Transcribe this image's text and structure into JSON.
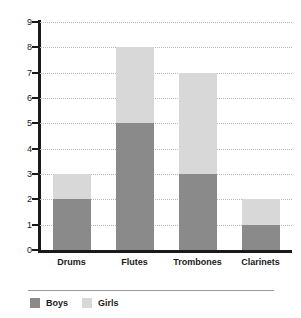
{
  "chart_data": {
    "type": "bar",
    "subtype": "stacked-bar",
    "title": "",
    "subtitle": "",
    "xlabel": "",
    "ylabel": "",
    "categories": [
      "Drums",
      "Flutes",
      "Trombones",
      "Clarinets"
    ],
    "series": [
      {
        "name": "Boys",
        "values": [
          2,
          5,
          3,
          1
        ],
        "color": "#8a8a8a"
      },
      {
        "name": "Girls",
        "values": [
          1,
          3,
          4,
          1
        ],
        "color": "#d8d8d8"
      }
    ],
    "totals": [
      3,
      8,
      7,
      2
    ],
    "ylim": [
      0,
      9
    ],
    "ytick_step": 1,
    "yticks": [
      0,
      1,
      2,
      3,
      4,
      5,
      6,
      7,
      8,
      9
    ],
    "ytick_labels": [
      "0",
      "1",
      "2",
      "3",
      "4",
      "5",
      "6",
      "7",
      "8",
      "9"
    ],
    "grid": true,
    "grid_style": "dotted",
    "grid_axis": "y",
    "legend": true,
    "legend_position": "bottom-left",
    "legend_entries": [
      "Boys",
      "Girls"
    ],
    "background_color": "#ffffff",
    "axis_color": "#1a1a1a",
    "grid_color": "#b8b8b8"
  }
}
